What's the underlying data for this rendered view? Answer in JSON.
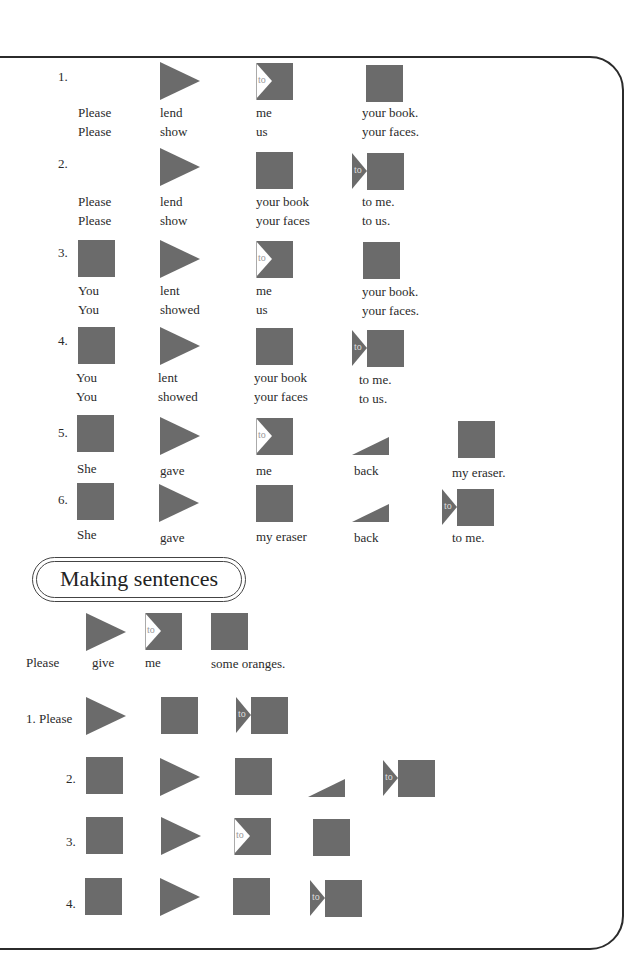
{
  "section_title": "Making sentences",
  "colors": {
    "shape": "#6b6b6b",
    "frame": "#2b2b2b",
    "text": "#2a2a2a"
  },
  "legend": {
    "square": "noun / object block",
    "triangle": "verb block",
    "to_square": "indirect object block (to)",
    "to_arrow": "to + object block",
    "wedge": "adverb block"
  },
  "to_label": "to",
  "patterns": [
    {
      "number": "1.",
      "shapes": [
        "triangle",
        "to-square",
        "square"
      ],
      "lines": [
        [
          "Please",
          "lend",
          "me",
          "your book."
        ],
        [
          "Please",
          "show",
          "us",
          "your faces."
        ]
      ]
    },
    {
      "number": "2.",
      "shapes": [
        "triangle",
        "square",
        "to-arrow"
      ],
      "lines": [
        [
          "Please",
          "lend",
          "your book",
          "to me."
        ],
        [
          "Please",
          "show",
          "your faces",
          "to us."
        ]
      ]
    },
    {
      "number": "3.",
      "shapes": [
        "square",
        "triangle",
        "to-square",
        "square"
      ],
      "lines": [
        [
          "You",
          "lent",
          "me",
          "your book."
        ],
        [
          "You",
          "showed",
          "us",
          "your faces."
        ]
      ]
    },
    {
      "number": "4.",
      "shapes": [
        "square",
        "triangle",
        "square",
        "to-arrow"
      ],
      "lines": [
        [
          "You",
          "lent",
          "your book",
          "to me."
        ],
        [
          "You",
          "showed",
          "your faces",
          "to us."
        ]
      ]
    },
    {
      "number": "5.",
      "shapes": [
        "square",
        "triangle",
        "to-square",
        "wedge",
        "square"
      ],
      "lines": [
        [
          "She",
          "gave",
          "me",
          "back",
          "my eraser."
        ]
      ]
    },
    {
      "number": "6.",
      "shapes": [
        "square",
        "triangle",
        "square",
        "wedge",
        "to-arrow"
      ],
      "lines": [
        [
          "She",
          "gave",
          "my eraser",
          "back",
          "to me."
        ]
      ]
    }
  ],
  "example": {
    "words": [
      "Please",
      "give",
      "me",
      "some oranges."
    ]
  },
  "exercises": [
    {
      "number": "1. Please",
      "shapes": [
        "triangle",
        "square",
        "to-arrow"
      ]
    },
    {
      "number": "2.",
      "shapes": [
        "square",
        "triangle",
        "square",
        "wedge",
        "to-arrow"
      ]
    },
    {
      "number": "3.",
      "shapes": [
        "square",
        "triangle",
        "to-square",
        "square"
      ]
    },
    {
      "number": "4.",
      "shapes": [
        "square",
        "triangle",
        "square",
        "to-arrow"
      ]
    }
  ]
}
